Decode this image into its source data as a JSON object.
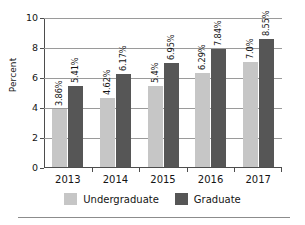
{
  "chart_data": {
    "type": "bar",
    "title": "",
    "subtitle": "",
    "xlabel": "",
    "ylabel": "Percent",
    "categories": [
      "2013",
      "2014",
      "2015",
      "2016",
      "2017"
    ],
    "ylim": [
      0,
      10
    ],
    "yticks": [
      0,
      2,
      4,
      6,
      8,
      10
    ],
    "ytick_labels": [
      "0",
      "2",
      "4",
      "6",
      "8",
      "10"
    ],
    "grid": true,
    "legend_position": "bottom",
    "series": [
      {
        "name": "Undergraduate",
        "color": "#c6c6c6",
        "values": [
          3.86,
          4.62,
          5.4,
          6.29,
          7.0
        ],
        "data_labels": [
          "3.86%",
          "4.62%",
          "5.4%",
          "6.29%",
          "7.0%"
        ]
      },
      {
        "name": "Graduate",
        "color": "#565656",
        "values": [
          5.41,
          6.17,
          6.95,
          7.84,
          8.55
        ],
        "data_labels": [
          "5.41%",
          "6.17%",
          "6.95%",
          "7.84%",
          "8.55%"
        ]
      }
    ]
  },
  "axes": {
    "y_title": "Percent",
    "y_tick_labels": [
      "10",
      "8",
      "6",
      "4",
      "2",
      "0"
    ],
    "x_tick_labels": [
      "2013",
      "2014",
      "2015",
      "2016",
      "2017"
    ]
  },
  "legend": {
    "items": [
      {
        "label": "Undergraduate",
        "color": "#c6c6c6"
      },
      {
        "label": "Graduate",
        "color": "#565656"
      }
    ]
  },
  "colors": {
    "undergraduate": "#c6c6c6",
    "graduate": "#565656",
    "axis": "#4d4d4d",
    "gridline": "#9a9a9a",
    "text": "#141414",
    "background": "#ffffff"
  }
}
